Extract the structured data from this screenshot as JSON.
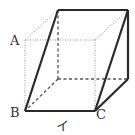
{
  "diagram": {
    "type": "cube-cross-section",
    "labels": {
      "A": "A",
      "B": "B",
      "C": "C",
      "edge_label": "イ"
    },
    "colors": {
      "bold_line": "#2a2a2a",
      "hidden_line": "#555555",
      "dotted_line": "#9a9a9a",
      "text": "#333333",
      "background": "#ffffff"
    }
  }
}
